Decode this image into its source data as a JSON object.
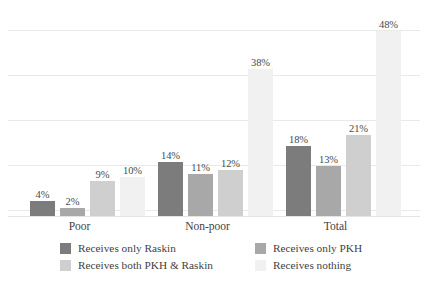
{
  "chart_data": {
    "type": "bar",
    "title": "",
    "subtitle": "",
    "xlabel": "",
    "ylabel": "",
    "categories": [
      "Poor",
      "Non-poor",
      "Total"
    ],
    "series": [
      {
        "name": "Receives only Raskin",
        "color": "#7c7c7c",
        "values": [
          4,
          2,
          18
        ]
      },
      {
        "name": "Receives only PKH",
        "color": "#a8a8a8",
        "values": [
          2,
          11,
          13
        ]
      },
      {
        "name": "Receives both PKH & Raskin",
        "color": "#cfcfcf",
        "values": [
          9,
          12,
          21
        ]
      },
      {
        "name": "Receives nothing",
        "color": "#f1f1f1",
        "values": [
          10,
          38,
          48
        ]
      }
    ],
    "value_labels": [
      [
        "4%",
        "2%",
        "9%",
        "10%"
      ],
      [
        "14%",
        "11%",
        "12%",
        "38%"
      ],
      [
        "18%",
        "13%",
        "21%",
        "48%"
      ]
    ],
    "ylim": [
      0,
      52.3
    ],
    "gridlines": [
      10.4,
      21.0,
      31.5,
      42.0,
      52.3
    ],
    "grid": true,
    "grid_color": "#e9e9e9",
    "legend_position": "bottom",
    "legend_columns": 2,
    "background": "#ffffff",
    "label_color": "#4a4a4a"
  },
  "groups": [
    {
      "label": "Poor",
      "bars": [
        {
          "series": "Receives only Raskin",
          "value": 4,
          "label": "4%",
          "color": "#7c7c7c"
        },
        {
          "series": "Receives only PKH",
          "value": 2,
          "label": "2%",
          "color": "#a8a8a8"
        },
        {
          "series": "Receives both PKH & Raskin",
          "value": 9,
          "label": "9%",
          "color": "#cfcfcf"
        },
        {
          "series": "Receives nothing",
          "value": 10,
          "label": "10%",
          "color": "#f1f1f1"
        }
      ]
    },
    {
      "label": "Non-poor",
      "bars": [
        {
          "series": "Receives only Raskin",
          "value": 14,
          "label": "14%",
          "color": "#7c7c7c"
        },
        {
          "series": "Receives only PKH",
          "value": 11,
          "label": "11%",
          "color": "#a8a8a8"
        },
        {
          "series": "Receives both PKH & Raskin",
          "value": 12,
          "label": "12%",
          "color": "#cfcfcf"
        },
        {
          "series": "Receives nothing",
          "value": 38,
          "label": "38%",
          "color": "#f1f1f1"
        }
      ]
    },
    {
      "label": "Total",
      "bars": [
        {
          "series": "Receives only Raskin",
          "value": 18,
          "label": "18%",
          "color": "#7c7c7c"
        },
        {
          "series": "Receives only PKH",
          "value": 13,
          "label": "13%",
          "color": "#a8a8a8"
        },
        {
          "series": "Receives both PKH & Raskin",
          "value": 21,
          "label": "21%",
          "color": "#cfcfcf"
        },
        {
          "series": "Receives nothing",
          "value": 48,
          "label": "48%",
          "color": "#f1f1f1"
        }
      ]
    }
  ],
  "legend": {
    "items": [
      {
        "label": "Receives only Raskin",
        "color": "#7c7c7c"
      },
      {
        "label": "Receives only PKH",
        "color": "#a8a8a8"
      },
      {
        "label": "Receives both PKH & Raskin",
        "color": "#cfcfcf"
      },
      {
        "label": "Receives nothing",
        "color": "#f1f1f1"
      }
    ]
  }
}
